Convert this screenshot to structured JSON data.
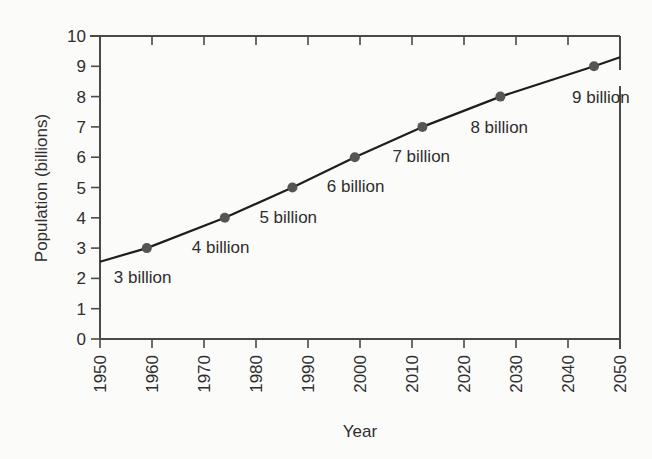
{
  "chart_data": {
    "type": "line",
    "title": "",
    "xlabel": "Year",
    "ylabel": "Population (billions)",
    "xlim": [
      1950,
      2050
    ],
    "ylim": [
      0,
      10
    ],
    "grid": false,
    "legend": null,
    "x_ticks": [
      1950,
      1960,
      1970,
      1980,
      1990,
      2000,
      2010,
      2020,
      2030,
      2040,
      2050
    ],
    "x_tick_labels": [
      "1950",
      "1960",
      "1970",
      "1980",
      "1990",
      "2000",
      "2010",
      "2020",
      "2030",
      "2040",
      "2050"
    ],
    "y_ticks": [
      0,
      1,
      2,
      3,
      4,
      5,
      6,
      7,
      8,
      9,
      10
    ],
    "y_tick_labels": [
      "0",
      "1",
      "2",
      "3",
      "4",
      "5",
      "6",
      "7",
      "8",
      "9",
      "10"
    ],
    "series": [
      {
        "name": "World population",
        "x": [
          1950,
          1959,
          1974,
          1987,
          1999,
          2012,
          2027,
          2045,
          2050
        ],
        "values": [
          2.55,
          3.0,
          4.0,
          5.0,
          6.0,
          7.0,
          8.0,
          9.0,
          9.3
        ]
      }
    ],
    "milestones": [
      {
        "year": 1959,
        "value": 3,
        "label": "3 billion"
      },
      {
        "year": 1974,
        "value": 4,
        "label": "4 billion"
      },
      {
        "year": 1987,
        "value": 5,
        "label": "5 billion"
      },
      {
        "year": 1999,
        "value": 6,
        "label": "6 billion"
      },
      {
        "year": 2012,
        "value": 7,
        "label": "7 billion"
      },
      {
        "year": 2027,
        "value": 8,
        "label": "8 billion"
      },
      {
        "year": 2045,
        "value": 9,
        "label": "9 billion"
      }
    ]
  },
  "colors": {
    "axis": "#4a4a4a",
    "line": "#1e1e1e",
    "marker": "#555555",
    "text": "#2e2e2e",
    "background": "#fbfbfa"
  }
}
